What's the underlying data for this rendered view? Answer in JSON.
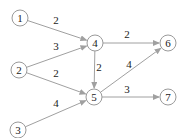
{
  "diagram": {
    "type": "weighted-directed-graph",
    "nodes": [
      {
        "id": "1",
        "label": "1",
        "x": 20,
        "y": 18
      },
      {
        "id": "2",
        "label": "2",
        "x": 19,
        "y": 70
      },
      {
        "id": "3",
        "label": "3",
        "x": 18,
        "y": 130
      },
      {
        "id": "4",
        "label": "4",
        "x": 95,
        "y": 43
      },
      {
        "id": "5",
        "label": "5",
        "x": 94,
        "y": 97
      },
      {
        "id": "6",
        "label": "6",
        "x": 168,
        "y": 43
      },
      {
        "id": "7",
        "label": "7",
        "x": 168,
        "y": 97
      }
    ],
    "edges": [
      {
        "from": "1",
        "to": "4",
        "weight": "2",
        "lx": 56,
        "ly": 24
      },
      {
        "from": "2",
        "to": "4",
        "weight": "3",
        "lx": 56,
        "ly": 50
      },
      {
        "from": "2",
        "to": "5",
        "weight": "2",
        "lx": 56,
        "ly": 77
      },
      {
        "from": "3",
        "to": "5",
        "weight": "4",
        "lx": 56,
        "ly": 107
      },
      {
        "from": "4",
        "to": "6",
        "weight": "2",
        "lx": 127,
        "ly": 38
      },
      {
        "from": "4",
        "to": "5",
        "weight": "2",
        "lx": 99,
        "ly": 71
      },
      {
        "from": "5",
        "to": "6",
        "weight": "4",
        "lx": 129,
        "ly": 68
      },
      {
        "from": "5",
        "to": "7",
        "weight": "3",
        "lx": 127,
        "ly": 93
      }
    ]
  }
}
